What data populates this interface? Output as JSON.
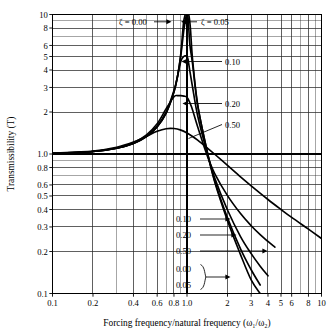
{
  "chart_data": {
    "type": "line",
    "title": "",
    "xlabel": "Forcing frequency/natural frequency (ω₁/ω₂)",
    "ylabel": "Transmissibility (T)",
    "xscale": "log",
    "yscale": "log",
    "xlim": [
      0.1,
      10
    ],
    "ylim": [
      0.1,
      10
    ],
    "grid": true,
    "legend_position": "inline-annotations",
    "xticks": [
      0.1,
      0.2,
      0.4,
      0.6,
      0.8,
      1.0,
      2,
      3,
      4,
      5,
      6,
      8,
      10
    ],
    "xticklabels": [
      "0.1",
      "0.2",
      "0.4",
      "0.6",
      "0.8",
      "1.0",
      "2",
      "3",
      "4",
      "5",
      "6",
      "8",
      "10"
    ],
    "yticks": [
      0.1,
      0.2,
      0.3,
      0.4,
      0.5,
      0.6,
      0.8,
      1.0,
      2,
      3,
      4,
      5,
      6,
      8,
      10
    ],
    "yticklabels": [
      "0.1",
      "0.2",
      "0.3",
      "0.4",
      "0.5",
      "0.6",
      "0.8",
      "1.0",
      "2",
      "3",
      "4",
      "5",
      "6",
      "8",
      "10"
    ],
    "series": [
      {
        "name": "ζ = 0.00",
        "zeta": 0.0,
        "x": [
          0.1,
          0.2,
          0.3,
          0.4,
          0.5,
          0.6,
          0.7,
          0.8,
          0.85,
          0.9,
          0.94,
          0.97,
          0.99,
          1.0,
          1.01,
          1.03,
          1.06,
          1.1,
          1.2,
          1.4,
          1.6,
          2.0,
          2.5,
          3.0,
          3.5
        ],
        "y": [
          1.01,
          1.042,
          1.099,
          1.19,
          1.333,
          1.563,
          1.961,
          2.778,
          3.6,
          5.26,
          8.55,
          10.0,
          10.0,
          10.0,
          10.0,
          10.0,
          8.0,
          4.76,
          2.27,
          1.08,
          0.641,
          0.333,
          0.19,
          0.125,
          0.0893
        ]
      },
      {
        "name": "ζ = 0.05",
        "zeta": 0.05,
        "x": [
          0.1,
          0.2,
          0.3,
          0.4,
          0.5,
          0.6,
          0.7,
          0.8,
          0.85,
          0.9,
          0.95,
          0.99,
          1.0,
          1.02,
          1.05,
          1.1,
          1.2,
          1.4,
          1.6,
          2.0,
          2.5,
          3.0,
          3.5
        ],
        "y": [
          1.01,
          1.042,
          1.099,
          1.191,
          1.335,
          1.566,
          1.97,
          2.793,
          3.6,
          5.1,
          7.9,
          10.0,
          10.0,
          9.3,
          6.1,
          4.42,
          2.23,
          1.09,
          0.652,
          0.349,
          0.209,
          0.148,
          0.115
        ]
      },
      {
        "name": "0.10",
        "zeta": 0.1,
        "x": [
          0.1,
          0.2,
          0.3,
          0.4,
          0.5,
          0.6,
          0.7,
          0.8,
          0.85,
          0.9,
          0.95,
          0.98,
          1.0,
          1.02,
          1.05,
          1.1,
          1.2,
          1.4,
          1.6,
          2.0,
          2.5,
          3.0,
          3.5,
          4.0
        ],
        "y": [
          1.01,
          1.042,
          1.1,
          1.193,
          1.342,
          1.583,
          2.003,
          2.847,
          3.59,
          4.62,
          5.02,
          5.05,
          5.03,
          4.72,
          3.93,
          3.01,
          1.88,
          1.05,
          0.68,
          0.397,
          0.256,
          0.193,
          0.157,
          0.134
        ]
      },
      {
        "name": "0.20",
        "zeta": 0.2,
        "x": [
          0.1,
          0.2,
          0.3,
          0.4,
          0.5,
          0.6,
          0.7,
          0.8,
          0.85,
          0.9,
          0.95,
          1.0,
          1.05,
          1.1,
          1.2,
          1.4,
          1.6,
          2.0,
          2.5,
          3.0,
          3.5,
          4.0,
          4.5
        ],
        "y": [
          1.01,
          1.043,
          1.104,
          1.206,
          1.373,
          1.648,
          2.113,
          2.575,
          2.62,
          2.62,
          2.6,
          2.55,
          2.33,
          2.07,
          1.57,
          1.0,
          0.73,
          0.503,
          0.374,
          0.306,
          0.264,
          0.236,
          0.215
        ]
      },
      {
        "name": "0.50",
        "zeta": 0.5,
        "x": [
          0.1,
          0.2,
          0.3,
          0.4,
          0.5,
          0.6,
          0.7,
          0.8,
          0.9,
          1.0,
          1.1,
          1.2,
          1.4,
          1.6,
          2.0,
          2.5,
          3.0,
          4.0,
          5.0,
          6.0,
          8.0,
          10.0
        ],
        "y": [
          1.012,
          1.051,
          1.119,
          1.219,
          1.342,
          1.455,
          1.518,
          1.522,
          1.483,
          1.414,
          1.336,
          1.257,
          1.114,
          1.0,
          0.828,
          0.685,
          0.591,
          0.472,
          0.4,
          0.351,
          0.289,
          0.248
        ]
      }
    ],
    "annotations": [
      {
        "id": "zeta-000-top",
        "text": "ζ  =  0.00",
        "arrow": "right"
      },
      {
        "id": "zeta-005-top",
        "text": "ζ  =  0.05",
        "arrow": "left"
      },
      {
        "id": "zeta-010-peak",
        "text": "0.10",
        "arrow": "left"
      },
      {
        "id": "zeta-020-peak",
        "text": "0.20",
        "arrow": "left"
      },
      {
        "id": "zeta-050-peak",
        "text": "0.50",
        "arrow": "leader"
      },
      {
        "id": "zeta-010-tail",
        "text": "0.10",
        "arrow": "right"
      },
      {
        "id": "zeta-020-tail",
        "text": "0.20",
        "arrow": "right"
      },
      {
        "id": "zeta-050-tail",
        "text": "0.50",
        "arrow": "right"
      },
      {
        "id": "zeta-000-tail",
        "text": "0.00",
        "arrow": "brace"
      },
      {
        "id": "zeta-005-tail",
        "text": "0.05",
        "arrow": "brace"
      }
    ],
    "colors": {
      "line": "#000000",
      "grid": "#000000",
      "axis": "#000000",
      "background": "#ffffff"
    }
  }
}
